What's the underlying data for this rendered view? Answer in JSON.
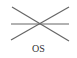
{
  "symbol": {
    "name": "os-symbol",
    "label": "OS",
    "stroke_color": "#666666",
    "lines": [
      {
        "x1": 12,
        "y1": 7,
        "x2": 69,
        "y2": 41
      },
      {
        "x1": 11,
        "y1": 24,
        "x2": 69,
        "y2": 24
      },
      {
        "x1": 11,
        "y1": 40,
        "x2": 69,
        "y2": 7
      }
    ]
  }
}
